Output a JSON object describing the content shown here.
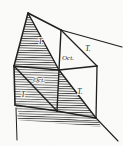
{
  "figure": {
    "type": "line-diagram",
    "width": 123,
    "height": 146,
    "background_color": "#fbfbf9",
    "ink_color": "#1d1d1d",
    "hatch_color": "#3a3a3a",
    "hatch_orientation": "horizontal",
    "labels": [
      {
        "id": "label-t-upper-left",
        "text": "T.",
        "x": 41,
        "y": 42,
        "size": 7.5
      },
      {
        "id": "label-oct-upper",
        "text": "Oct.",
        "x": 68,
        "y": 58,
        "size": 7.0
      },
      {
        "id": "label-t-upper-right",
        "text": "T.",
        "x": 88,
        "y": 49,
        "size": 7.5
      },
      {
        "id": "label-oct-lower",
        "text": "Oct.",
        "x": 39,
        "y": 80,
        "size": 7.0
      },
      {
        "id": "label-t-lower-left",
        "text": "T",
        "x": 23,
        "y": 95,
        "size": 7.5
      },
      {
        "id": "label-t-lower-right",
        "text": "T.",
        "x": 80,
        "y": 92,
        "size": 7.5
      }
    ],
    "vertices": {
      "apex_top_left": [
        28,
        13
      ],
      "top_mid": [
        61,
        30
      ],
      "right_upper_outer": [
        122,
        47
      ],
      "right_mid": [
        97,
        66
      ],
      "center": [
        59,
        70
      ],
      "left_mid": [
        14,
        66
      ],
      "bottom_left": [
        15,
        105
      ],
      "bottom_mid": [
        57,
        111
      ],
      "bottom_right": [
        96,
        118
      ],
      "tail_bottom_left": [
        17,
        140
      ],
      "tail_bottom_right": [
        118,
        141
      ]
    },
    "edges": [
      {
        "from": "apex_top_left",
        "to": "top_mid"
      },
      {
        "from": "top_mid",
        "to": "right_upper_outer"
      },
      {
        "from": "top_mid",
        "to": "right_mid"
      },
      {
        "from": "top_mid",
        "to": "center"
      },
      {
        "from": "apex_top_left",
        "to": "center"
      },
      {
        "from": "apex_top_left",
        "to": "left_mid"
      },
      {
        "from": "left_mid",
        "to": "center"
      },
      {
        "from": "center",
        "to": "right_mid"
      },
      {
        "from": "right_mid",
        "to": "bottom_right"
      },
      {
        "from": "center",
        "to": "bottom_right"
      },
      {
        "from": "center",
        "to": "bottom_mid"
      },
      {
        "from": "left_mid",
        "to": "bottom_left"
      },
      {
        "from": "left_mid",
        "to": "bottom_mid"
      },
      {
        "from": "bottom_left",
        "to": "bottom_mid"
      },
      {
        "from": "bottom_mid",
        "to": "bottom_right"
      },
      {
        "from": "bottom_left",
        "to": "tail_bottom_left"
      },
      {
        "from": "bottom_right",
        "to": "tail_bottom_right"
      }
    ],
    "hatched_regions": [
      "upper-left-triangle-left-half",
      "lower-left-quadrilateral",
      "lower-center-triangle",
      "bottom-skirt-band"
    ]
  }
}
